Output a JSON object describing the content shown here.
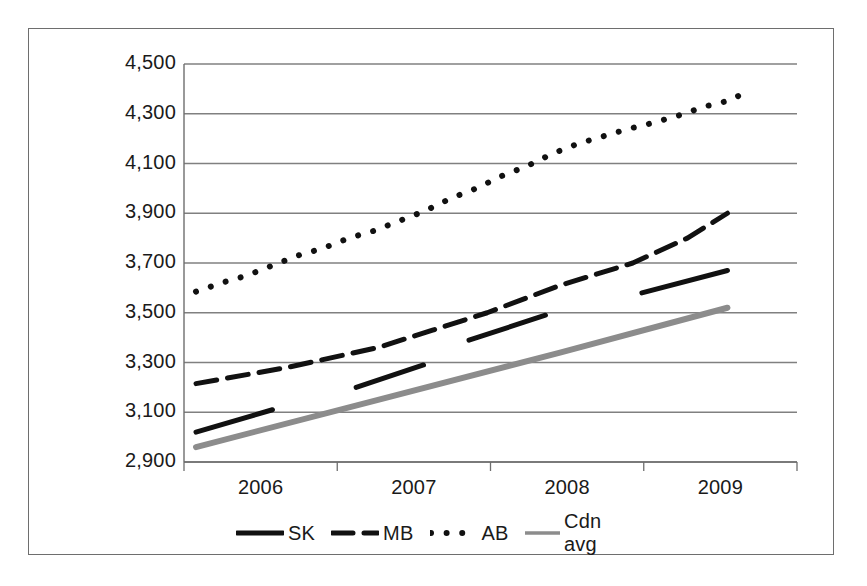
{
  "chart_data": {
    "type": "line",
    "title": "",
    "xlabel": "",
    "ylabel": "",
    "xlim": [
      2006,
      2009
    ],
    "ylim": [
      2900,
      4500
    ],
    "ytick_labels": [
      "4,500",
      "4,300",
      "4,100",
      "3,900",
      "3,700",
      "3,500",
      "3,300",
      "3,100",
      "2,900"
    ],
    "ytick_values": [
      4500,
      4300,
      4100,
      3900,
      3700,
      3500,
      3300,
      3100,
      2900
    ],
    "xtick_labels": [
      "2006",
      "2007",
      "2008",
      "2009"
    ],
    "xtick_values": [
      2006,
      2007,
      2008,
      2009
    ],
    "grid": "horizontal",
    "legend_position": "bottom",
    "series": [
      {
        "name": "SK",
        "style": "solid",
        "color": "#111111",
        "width": 5,
        "points": [
          [
            2006.0,
            3020
          ],
          [
            2006.42,
            3110
          ],
          [
            2006.88,
            3200
          ],
          [
            2007.25,
            3290
          ],
          [
            2007.5,
            3390
          ],
          [
            2007.92,
            3490
          ],
          [
            2008.45,
            3580
          ],
          [
            2008.92,
            3670
          ]
        ],
        "segments": [
          [
            0,
            1
          ],
          [
            2,
            3
          ],
          [
            4,
            5
          ],
          [
            6,
            7
          ]
        ]
      },
      {
        "name": "MB",
        "style": "dashed",
        "color": "#111111",
        "width": 5,
        "points": [
          [
            2006.0,
            3215
          ],
          [
            2006.5,
            3280
          ],
          [
            2007.0,
            3360
          ],
          [
            2007.3,
            3430
          ],
          [
            2007.6,
            3500
          ],
          [
            2008.0,
            3610
          ],
          [
            2008.4,
            3700
          ],
          [
            2008.7,
            3800
          ],
          [
            2008.92,
            3900
          ]
        ]
      },
      {
        "name": "AB",
        "style": "dotted",
        "color": "#111111",
        "width": 6,
        "points": [
          [
            2006.0,
            3585
          ],
          [
            2006.14,
            3620
          ],
          [
            2006.28,
            3650
          ],
          [
            2006.42,
            3690
          ],
          [
            2006.56,
            3730
          ],
          [
            2006.7,
            3760
          ],
          [
            2006.84,
            3800
          ],
          [
            2006.98,
            3830
          ],
          [
            2007.12,
            3870
          ],
          [
            2007.26,
            3910
          ],
          [
            2007.4,
            3960
          ],
          [
            2007.54,
            4000
          ],
          [
            2007.68,
            4050
          ],
          [
            2007.82,
            4090
          ],
          [
            2007.96,
            4140
          ],
          [
            2008.1,
            4180
          ],
          [
            2008.24,
            4210
          ],
          [
            2008.38,
            4240
          ],
          [
            2008.52,
            4265
          ],
          [
            2008.66,
            4295
          ],
          [
            2008.8,
            4330
          ],
          [
            2008.94,
            4355
          ],
          [
            2009.0,
            4380
          ]
        ]
      },
      {
        "name": "Cdn avg",
        "style": "solid",
        "color": "#8c8c8c",
        "width": 6,
        "points": [
          [
            2006.0,
            2960
          ],
          [
            2007.0,
            3150
          ],
          [
            2008.0,
            3340
          ],
          [
            2008.92,
            3520
          ]
        ]
      }
    ],
    "legend": [
      {
        "label": "SK",
        "style": "solid",
        "color": "#111111"
      },
      {
        "label": "MB",
        "style": "dashed",
        "color": "#111111"
      },
      {
        "label": "AB",
        "style": "dotted",
        "color": "#111111"
      },
      {
        "label": "Cdn avg",
        "style": "solid",
        "color": "#8c8c8c"
      }
    ]
  },
  "geometry": {
    "plot_left": 196,
    "plot_right": 742,
    "plot_top": 64,
    "plot_bottom": 462,
    "axis_color": "#6e6e6e",
    "grid_color": "#808080"
  }
}
